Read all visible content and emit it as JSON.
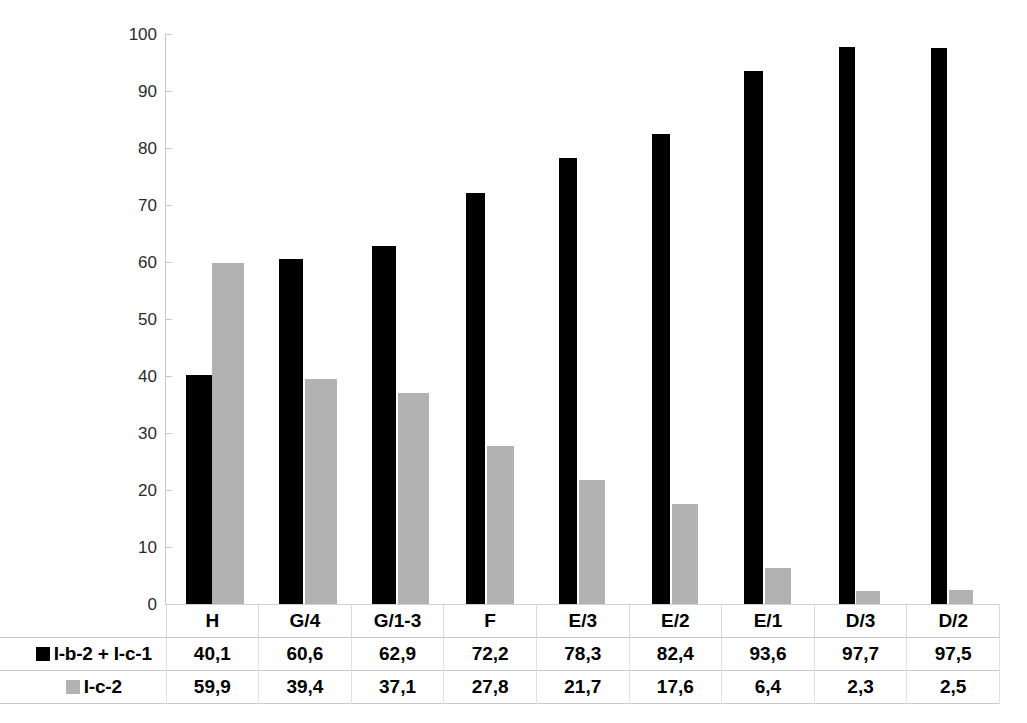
{
  "chart_data": {
    "type": "bar",
    "title": "",
    "subtitle": "",
    "xlabel": "",
    "ylabel": "",
    "ylim": [
      0,
      100
    ],
    "grid": false,
    "legend_position": "table-left",
    "categories": [
      "H",
      "G/4",
      "G/1-3",
      "F",
      "E/3",
      "E/2",
      "E/1",
      "D/3",
      "D/2"
    ],
    "y_ticks": [
      100,
      90,
      80,
      70,
      60,
      50,
      40,
      30,
      20,
      10,
      0
    ],
    "series": [
      {
        "name": "I-b-2 + I-c-1",
        "color": "#000000",
        "swatch": "black-square-marker",
        "values": [
          40.1,
          60.6,
          62.9,
          72.2,
          78.3,
          82.4,
          93.6,
          97.7,
          97.5
        ],
        "labels": [
          "40,1",
          "60,6",
          "62,9",
          "72,2",
          "78,3",
          "82,4",
          "93,6",
          "97,7",
          "97,5"
        ]
      },
      {
        "name": "I-c-2",
        "color": "#b2b2b2",
        "swatch": "gray-square-marker",
        "values": [
          59.9,
          39.4,
          37.1,
          27.8,
          21.7,
          17.6,
          6.4,
          2.3,
          2.5
        ],
        "labels": [
          "59,9",
          "39,4",
          "37,1",
          "27,8",
          "21,7",
          "17,6",
          "6,4",
          "2,3",
          "2,5"
        ]
      }
    ]
  },
  "bar_geometry": {
    "black_widths_pct": [
      28,
      26,
      26,
      20,
      20,
      20,
      20,
      17,
      17
    ],
    "gray_widths_pct": [
      34,
      34,
      34,
      30,
      28,
      28,
      28,
      26,
      26
    ],
    "black_left_pct": [
      22,
      22,
      22,
      24,
      24,
      24,
      24,
      26,
      26
    ],
    "gray_left_pct": [
      50,
      50,
      50,
      46,
      46,
      46,
      46,
      45,
      45
    ]
  }
}
